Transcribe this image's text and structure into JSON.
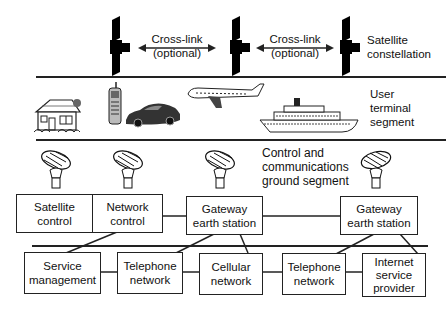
{
  "segments": {
    "space": {
      "label_line1": "Satellite",
      "label_line2": "constellation"
    },
    "user": {
      "label_line1": "User",
      "label_line2": "terminal",
      "label_line3": "segment"
    },
    "ground": {
      "label_line1": "Control and",
      "label_line2": "communications",
      "label_line3": "ground segment"
    }
  },
  "crosslinks": [
    {
      "line1": "Cross-link",
      "line2": "(optional)"
    },
    {
      "line1": "Cross-link",
      "line2": "(optional)"
    }
  ],
  "satellites": [
    "satellite-1",
    "satellite-2",
    "satellite-3"
  ],
  "user_terminals": [
    "house",
    "mobile-phone",
    "car",
    "airplane",
    "ship"
  ],
  "ground_boxes": [
    {
      "line1": "Satellite",
      "line2": "control"
    },
    {
      "line1": "Network",
      "line2": "control"
    },
    {
      "line1": "Gateway",
      "line2": "earth station"
    },
    {
      "line1": "Gateway",
      "line2": "earth station"
    }
  ],
  "network_boxes": [
    {
      "line1": "Service",
      "line2": "management"
    },
    {
      "line1": "Telephone",
      "line2": "network"
    },
    {
      "line1": "Cellular",
      "line2": "network"
    },
    {
      "line1": "Telephone",
      "line2": "network"
    },
    {
      "line1": "Internet",
      "line2": "service",
      "line3": "provider"
    }
  ],
  "colors": {
    "line": "#222222",
    "background": "#ffffff"
  }
}
